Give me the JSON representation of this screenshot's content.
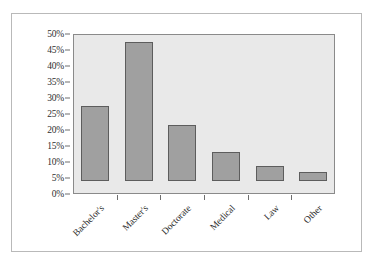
{
  "chart_data": {
    "type": "bar",
    "title": "",
    "subtitle": "",
    "xlabel": "",
    "ylabel": "",
    "categories": [
      "Bachelor's",
      "Master's",
      "Doctorate",
      "Medical",
      "Law",
      "Other"
    ],
    "values": [
      23.5,
      43.5,
      17.5,
      9.0,
      4.8,
      2.8
    ],
    "series": [
      {
        "name": "Share",
        "values": [
          23.5,
          43.5,
          17.5,
          9.0,
          4.8,
          2.8
        ]
      }
    ],
    "ylim": [
      0,
      50
    ],
    "ytick_values": [
      0,
      5,
      10,
      15,
      20,
      25,
      30,
      35,
      40,
      45,
      50
    ],
    "ytick_labels": [
      "0%",
      "5%",
      "10%",
      "15%",
      "20%",
      "25%",
      "30%",
      "35%",
      "40%",
      "45%",
      "50%"
    ],
    "grid": false,
    "legend": "none",
    "bar_color": "#a0a0a0",
    "bar_border_color": "#5d5d5d",
    "plot_background": "#e9e9e9",
    "plot_border_color": "#8a8a8a",
    "axis_text_color": "#2e2e2e",
    "frame_border_color": "#b9b9b9",
    "page_background": "#ffffff",
    "xlabel_rotation_degrees": -45
  }
}
